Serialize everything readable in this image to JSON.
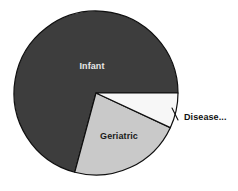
{
  "chart_data": {
    "type": "pie",
    "title": "",
    "subtitle": "",
    "xlabel": "",
    "ylabel": "",
    "grid": false,
    "legend_position": "none",
    "labels_inside": true,
    "categories": [
      "Infant",
      "Geriatric",
      "Disease..."
    ],
    "values": [
      71,
      22,
      7
    ],
    "slices": [
      {
        "label": "Infant",
        "value": 71,
        "color": "#3d3d3d",
        "label_color": "#e8e8e8",
        "start_angle_deg": 105,
        "end_angle_deg": 360,
        "label_placement": "inside"
      },
      {
        "label": "Geriatric",
        "value": 22,
        "color": "#c9c9c9",
        "label_color": "#1a1a1a",
        "start_angle_deg": 25,
        "end_angle_deg": 105,
        "label_placement": "inside"
      },
      {
        "label": "Disease...",
        "value": 7,
        "color": "#f7f7f7",
        "label_color": "#111111",
        "start_angle_deg": 0,
        "end_angle_deg": 25,
        "label_placement": "callout"
      }
    ],
    "annotations": [
      {
        "name": "disease-callout",
        "text": "Disease...",
        "truncated": true
      }
    ],
    "geometry": {
      "center_x": 96,
      "center_y": 93,
      "radius": 82,
      "stroke_color": "#0f0f0f",
      "stroke_width": 1.2,
      "background": "#ffffff"
    }
  },
  "labels": {
    "infant": "Infant",
    "geriatric": "Geriatric",
    "disease": "Disease..."
  },
  "colors": {
    "infant_fill": "#3d3d3d",
    "geriatric_fill": "#c9c9c9",
    "disease_fill": "#f7f7f7",
    "outline": "#0f0f0f",
    "background": "#ffffff",
    "light_text": "#e8e8e8",
    "dark_text": "#1a1a1a"
  }
}
